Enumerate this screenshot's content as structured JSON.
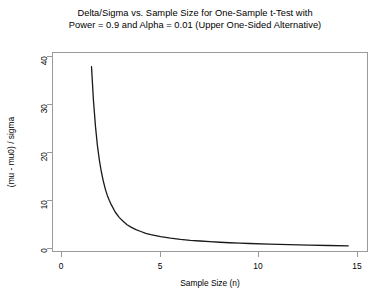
{
  "chart_data": {
    "type": "line",
    "title": "Delta/Sigma vs. Sample Size for One-Sample t-Test with Power = 0.9 and Alpha = 0.01 (Upper One-Sided Alternative)",
    "title_line1": "Delta/Sigma vs. Sample Size for One-Sample t-Test with",
    "title_line2": "Power = 0.9 and Alpha = 0.01 (Upper One-Sided Alternative)",
    "xlabel": "Sample Size (n)",
    "ylabel": "(mu - mu0) / sigma",
    "xlim": [
      0,
      16
    ],
    "ylim": [
      0,
      41
    ],
    "xticks": [
      0,
      5,
      10,
      15
    ],
    "xticklabels": [
      "0",
      "5",
      "10",
      "15"
    ],
    "yticks": [
      0,
      10,
      20,
      30,
      40
    ],
    "yticklabels": [
      "0",
      "10",
      "20",
      "30",
      "40"
    ],
    "grid": false,
    "legend": null,
    "line_color": "#1a1a1a",
    "frame_color": "#9a9a9a",
    "background": "#ffffff",
    "series": [
      {
        "name": "delta/sigma",
        "x": [
          2.0,
          2.1,
          2.2,
          2.3,
          2.4,
          2.5,
          2.6,
          2.7,
          2.8,
          2.9,
          3.0,
          3.2,
          3.4,
          3.6,
          3.8,
          4.0,
          4.25,
          4.5,
          4.75,
          5.0,
          5.5,
          6.0,
          6.5,
          7.0,
          7.5,
          8.0,
          8.5,
          9.0,
          9.5,
          10.0,
          11.0,
          12.0,
          13.0,
          14.0,
          15.0
        ],
        "y": [
          38.0,
          31.0,
          25.8,
          21.8,
          18.8,
          16.4,
          14.5,
          12.9,
          11.6,
          10.6,
          9.7,
          8.2,
          7.1,
          6.3,
          5.6,
          5.1,
          4.6,
          4.2,
          3.8,
          3.55,
          3.15,
          2.85,
          2.6,
          2.4,
          2.25,
          2.12,
          2.0,
          1.9,
          1.82,
          1.74,
          1.6,
          1.5,
          1.41,
          1.33,
          1.26
        ]
      }
    ]
  }
}
